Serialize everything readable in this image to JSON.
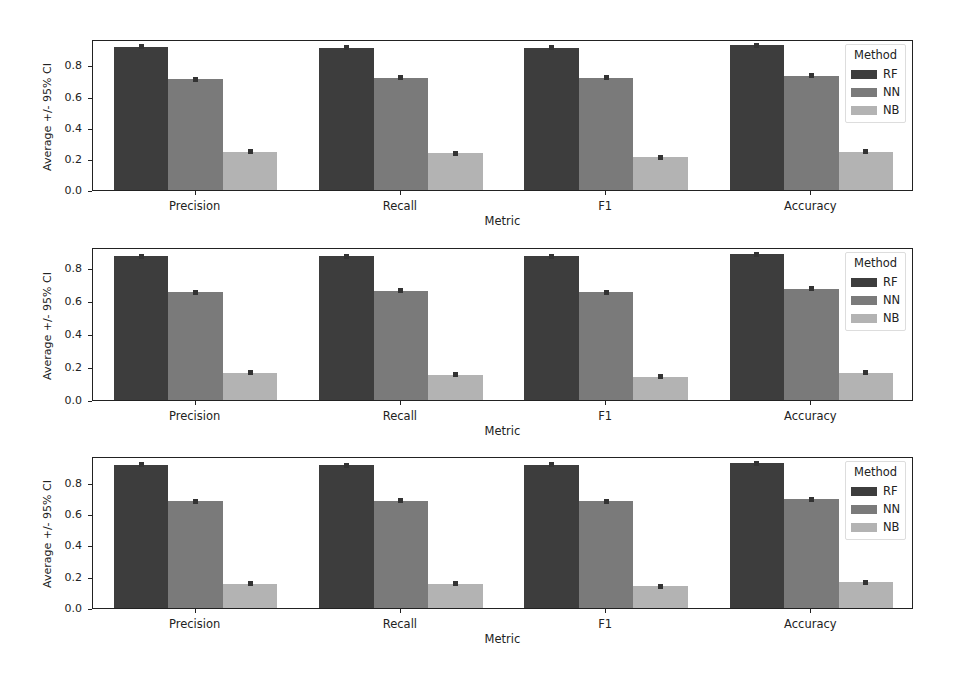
{
  "colors": {
    "RF": "#3d3d3d",
    "NN": "#7a7a7a",
    "NB": "#b3b3b3",
    "axis": "#222222"
  },
  "legend": {
    "title": "Method",
    "entries": [
      "RF",
      "NN",
      "NB"
    ]
  },
  "yaxis_title": "Average +/- 95% CI",
  "xaxis_title": "Metric",
  "yticks": [
    "0.0",
    "0.2",
    "0.4",
    "0.6",
    "0.8"
  ],
  "categories": [
    "Precision",
    "Recall",
    "F1",
    "Accuracy"
  ],
  "chart_data": [
    {
      "type": "bar",
      "title": "",
      "xlabel": "Metric",
      "ylabel": "Average +/- 95% CI",
      "ylim": [
        0,
        0.97
      ],
      "grid": false,
      "legend_position": "upper right",
      "categories": [
        "Precision",
        "Recall",
        "F1",
        "Accuracy"
      ],
      "series": [
        {
          "name": "RF",
          "values": [
            0.92,
            0.915,
            0.915,
            0.93
          ]
        },
        {
          "name": "NN",
          "values": [
            0.71,
            0.72,
            0.72,
            0.735
          ]
        },
        {
          "name": "NB",
          "values": [
            0.245,
            0.235,
            0.21,
            0.245
          ]
        }
      ]
    },
    {
      "type": "bar",
      "title": "",
      "xlabel": "Metric",
      "ylabel": "Average +/- 95% CI",
      "ylim": [
        0,
        0.93
      ],
      "grid": false,
      "legend_position": "upper right",
      "categories": [
        "Precision",
        "Recall",
        "F1",
        "Accuracy"
      ],
      "series": [
        {
          "name": "RF",
          "values": [
            0.875,
            0.875,
            0.875,
            0.885
          ]
        },
        {
          "name": "NN",
          "values": [
            0.655,
            0.665,
            0.655,
            0.675
          ]
        },
        {
          "name": "NB",
          "values": [
            0.165,
            0.155,
            0.14,
            0.165
          ]
        }
      ]
    },
    {
      "type": "bar",
      "title": "",
      "xlabel": "Metric",
      "ylabel": "Average +/- 95% CI",
      "ylim": [
        0,
        0.97
      ],
      "grid": false,
      "legend_position": "upper right",
      "categories": [
        "Precision",
        "Recall",
        "F1",
        "Accuracy"
      ],
      "series": [
        {
          "name": "RF",
          "values": [
            0.915,
            0.91,
            0.915,
            0.925
          ]
        },
        {
          "name": "NN",
          "values": [
            0.68,
            0.685,
            0.68,
            0.695
          ]
        },
        {
          "name": "NB",
          "values": [
            0.155,
            0.155,
            0.14,
            0.165
          ]
        }
      ]
    }
  ]
}
